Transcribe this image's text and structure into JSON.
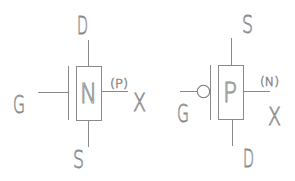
{
  "diagram": {
    "colors": {
      "line": "#8a8a8a",
      "background": "#ffffff"
    },
    "transistors": [
      {
        "type": "NMOS",
        "body_label": "N",
        "gate_label": "G",
        "top_label": "D",
        "bottom_label": "S",
        "bulk_label": "X",
        "bulk_type_label": "(P)",
        "gate_bubble": false
      },
      {
        "type": "PMOS",
        "body_label": "P",
        "gate_label": "G",
        "top_label": "S",
        "bottom_label": "D",
        "bulk_label": "X",
        "bulk_type_label": "(N)",
        "gate_bubble": true
      }
    ]
  }
}
